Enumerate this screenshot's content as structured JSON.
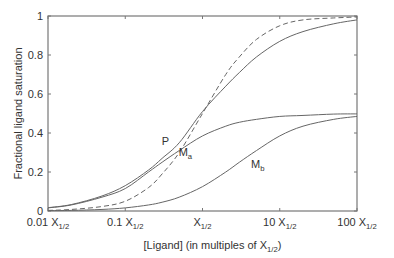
{
  "chart_data": {
    "type": "line",
    "title": "",
    "xlabel": "[Ligand] (in multiples of X",
    "xlabel_sub": "1/2",
    "xlabel_end": ")",
    "ylabel": "Fractional ligand saturation",
    "xscale": "log",
    "xlim": [
      0.01,
      100
    ],
    "ylim": [
      0,
      1
    ],
    "xticks": [
      {
        "value": 0.01,
        "label": "0.01 X",
        "sub": "1/2"
      },
      {
        "value": 0.1,
        "label": "0.1 X",
        "sub": "1/2"
      },
      {
        "value": 1,
        "label": "X",
        "sub": "1/2"
      },
      {
        "value": 10,
        "label": "10 X",
        "sub": "1/2"
      },
      {
        "value": 100,
        "label": "100 X",
        "sub": "1/2"
      }
    ],
    "yticks": [
      {
        "value": 0,
        "label": "0"
      },
      {
        "value": 0.2,
        "label": "0.2"
      },
      {
        "value": 0.4,
        "label": "0.4"
      },
      {
        "value": 0.6,
        "label": "0.6"
      },
      {
        "value": 0.8,
        "label": "0.8"
      },
      {
        "value": 1,
        "label": "1"
      }
    ],
    "x": [
      0.01,
      0.02,
      0.05,
      0.1,
      0.2,
      0.3,
      0.5,
      1,
      2,
      3,
      5,
      10,
      20,
      50,
      100
    ],
    "series": [
      {
        "name": "P",
        "label": "P",
        "style": "solid",
        "values": [
          0.017,
          0.033,
          0.077,
          0.13,
          0.21,
          0.27,
          0.35,
          0.51,
          0.64,
          0.71,
          0.79,
          0.87,
          0.92,
          0.96,
          0.98
        ]
      },
      {
        "name": "Ma",
        "label": "M",
        "label_sub": "a",
        "style": "solid",
        "values": [
          0.016,
          0.031,
          0.071,
          0.115,
          0.2,
          0.25,
          0.31,
          0.385,
          0.435,
          0.455,
          0.47,
          0.485,
          0.49,
          0.497,
          0.498
        ]
      },
      {
        "name": "Mb",
        "label": "M",
        "label_sub": "b",
        "style": "solid",
        "values": [
          0.002,
          0.003,
          0.008,
          0.016,
          0.031,
          0.045,
          0.071,
          0.125,
          0.2,
          0.25,
          0.31,
          0.385,
          0.435,
          0.47,
          0.485
        ]
      },
      {
        "name": "reference",
        "label": "",
        "style": "dashed",
        "values": [
          0.003,
          0.008,
          0.023,
          0.05,
          0.12,
          0.19,
          0.3,
          0.5,
          0.7,
          0.79,
          0.88,
          0.95,
          0.98,
          0.99,
          0.995
        ]
      }
    ],
    "annotations": [
      {
        "series": "P",
        "text": "P",
        "x": 0.33,
        "y": 0.34
      },
      {
        "series": "Ma",
        "text": "M",
        "sub": "a",
        "x": 0.6,
        "y": 0.28
      },
      {
        "series": "Mb",
        "text": "M",
        "sub": "b",
        "x": 5.2,
        "y": 0.22
      }
    ],
    "grid": false,
    "legend": "none"
  }
}
